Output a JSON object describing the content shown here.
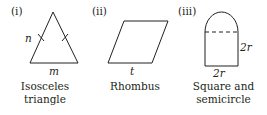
{
  "figure": {
    "stroke_color": "#231f20",
    "background": "#ffffff",
    "items": [
      {
        "index_label": "(i)",
        "shape": "isosceles-triangle",
        "side_label": "n",
        "base_label": "m",
        "tick_marks": 2,
        "caption_lines": [
          "Isosceles",
          "triangle"
        ]
      },
      {
        "index_label": "(ii)",
        "shape": "rhombus",
        "base_label": "t",
        "caption_lines": [
          "Rhombus"
        ]
      },
      {
        "index_label": "(iii)",
        "shape": "square-and-semicircle",
        "height_label": "2r",
        "base_label": "2r",
        "dashed_divider": true,
        "caption_lines": [
          "Square and",
          "semicircle"
        ]
      }
    ]
  }
}
